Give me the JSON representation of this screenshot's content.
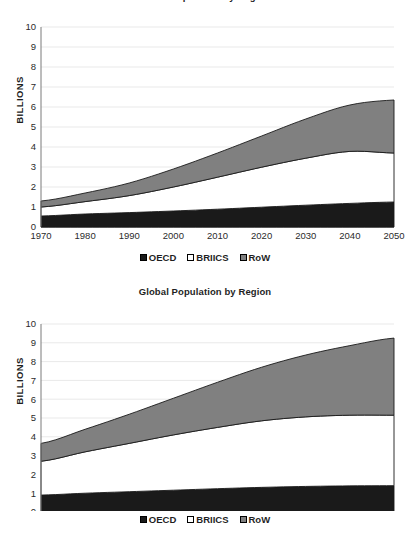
{
  "charts": [
    {
      "title": "Urban Population by Region",
      "ylabel": "BILLIONS",
      "legend": [
        {
          "label": "OECD",
          "color": "#1a1a1a",
          "icon": "square-swatch-icon"
        },
        {
          "label": "BRIICS",
          "color": "#ffffff",
          "icon": "square-swatch-icon"
        },
        {
          "label": "RoW",
          "color": "#808080",
          "icon": "square-swatch-icon"
        }
      ]
    },
    {
      "title": "Global Population by Region",
      "ylabel": "BILLIONS",
      "legend": [
        {
          "label": "OECD",
          "color": "#1a1a1a",
          "icon": "square-swatch-icon"
        },
        {
          "label": "BRIICS",
          "color": "#ffffff",
          "icon": "square-swatch-icon"
        },
        {
          "label": "RoW",
          "color": "#808080",
          "icon": "square-swatch-icon"
        }
      ]
    }
  ],
  "chart_data": [
    {
      "type": "area",
      "title": "Urban Population by Region",
      "xlabel": "",
      "ylabel": "BILLIONS",
      "stacked": true,
      "grid": true,
      "legend_position": "bottom",
      "x": [
        1970,
        1980,
        1990,
        2000,
        2010,
        2020,
        2030,
        2040,
        2050
      ],
      "xticklabels": [
        "1970",
        "1980",
        "1990",
        "2000",
        "2010",
        "2020",
        "2030",
        "2040",
        "2050"
      ],
      "yticklabels": [
        "0",
        "1",
        "2",
        "3",
        "4",
        "5",
        "6",
        "7",
        "8",
        "9",
        "10"
      ],
      "xlim": [
        1970,
        2050
      ],
      "ylim": [
        0,
        10
      ],
      "series": [
        {
          "name": "OECD",
          "color": "#1a1a1a",
          "values": [
            0.55,
            0.65,
            0.72,
            0.8,
            0.89,
            0.99,
            1.09,
            1.18,
            1.25
          ]
        },
        {
          "name": "BRIICS",
          "color": "#ffffff",
          "values": [
            0.45,
            0.62,
            0.85,
            1.2,
            1.6,
            2.0,
            2.35,
            2.6,
            2.45
          ]
        },
        {
          "name": "RoW",
          "color": "#808080",
          "values": [
            0.3,
            0.43,
            0.63,
            0.9,
            1.21,
            1.56,
            1.96,
            2.32,
            2.65
          ]
        }
      ],
      "totals": [
        1.3,
        1.7,
        2.2,
        2.9,
        3.7,
        4.55,
        5.4,
        6.1,
        6.35
      ]
    },
    {
      "type": "area",
      "title": "Global Population by Region",
      "xlabel": "",
      "ylabel": "BILLIONS",
      "stacked": true,
      "grid": true,
      "legend_position": "bottom",
      "x": [
        1970,
        1980,
        1990,
        2000,
        2010,
        2020,
        2030,
        2040,
        2050
      ],
      "xticklabels": [
        "1970",
        "1980",
        "1990",
        "2000",
        "2010",
        "2020",
        "2030",
        "2040",
        "2050"
      ],
      "yticklabels": [
        "0",
        "1",
        "2",
        "3",
        "4",
        "5",
        "6",
        "7",
        "8",
        "9",
        "10"
      ],
      "xlim": [
        1970,
        2050
      ],
      "ylim": [
        0,
        10
      ],
      "series": [
        {
          "name": "OECD",
          "color": "#1a1a1a",
          "values": [
            0.9,
            1.0,
            1.08,
            1.16,
            1.24,
            1.31,
            1.36,
            1.39,
            1.4
          ]
        },
        {
          "name": "BRIICS",
          "color": "#ffffff",
          "values": [
            1.8,
            2.2,
            2.57,
            2.94,
            3.26,
            3.54,
            3.7,
            3.76,
            3.75
          ]
        },
        {
          "name": "RoW",
          "color": "#808080",
          "values": [
            0.95,
            1.2,
            1.55,
            1.95,
            2.4,
            2.85,
            3.29,
            3.7,
            4.1
          ]
        }
      ],
      "totals": [
        3.65,
        4.4,
        5.2,
        6.05,
        6.9,
        7.7,
        8.35,
        8.85,
        9.25
      ]
    }
  ]
}
